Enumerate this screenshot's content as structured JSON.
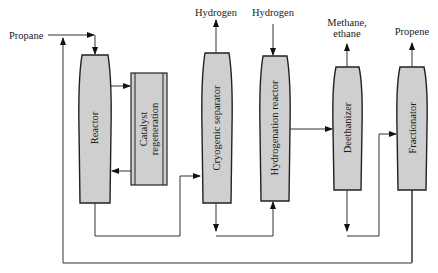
{
  "diagram": {
    "type": "process-flow",
    "units": [
      {
        "id": "reactor",
        "label": "Reactor"
      },
      {
        "id": "catalyst",
        "label_line1": "Catalyst",
        "label_line2": "regeneration"
      },
      {
        "id": "cryogenic",
        "label": "Cryogenic separator"
      },
      {
        "id": "hydrogenation",
        "label": "Hydrogenation reactor"
      },
      {
        "id": "deethanizer",
        "label": "Deethanizer"
      },
      {
        "id": "fractionator",
        "label": "Fractionator"
      }
    ],
    "streams": {
      "feed": "Propane",
      "cryo_out": "Hydrogen",
      "hydro_in": "Hydrogen",
      "deeth_out_line1": "Methane,",
      "deeth_out_line2": "ethane",
      "product": "Propene"
    },
    "connections": [
      [
        "Propane",
        "Reactor"
      ],
      [
        "Reactor",
        "Catalyst regeneration"
      ],
      [
        "Catalyst regeneration",
        "Reactor"
      ],
      [
        "Reactor",
        "Cryogenic separator"
      ],
      [
        "Cryogenic separator",
        "Hydrogen"
      ],
      [
        "Cryogenic separator",
        "Hydrogenation reactor"
      ],
      [
        "Hydrogen",
        "Hydrogenation reactor"
      ],
      [
        "Hydrogenation reactor",
        "Deethanizer"
      ],
      [
        "Deethanizer",
        "Methane, ethane"
      ],
      [
        "Deethanizer",
        "Fractionator"
      ],
      [
        "Fractionator",
        "Propene"
      ],
      [
        "Fractionator",
        "Reactor (recycle)"
      ]
    ],
    "colors": {
      "unit_fill": "#cfcfcf",
      "line": "#333333"
    }
  }
}
